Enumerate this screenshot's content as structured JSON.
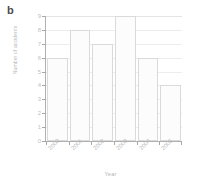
{
  "figure": {
    "panel_label": "b"
  },
  "chart_data": {
    "type": "bar",
    "title": "",
    "categories": [
      "2000",
      "2001",
      "2002",
      "2003",
      "2004",
      "2005"
    ],
    "values": [
      6,
      8,
      7,
      9,
      6,
      4
    ],
    "xlabel": "Year",
    "ylabel": "Number of accidents",
    "ylim": [
      0,
      9
    ],
    "yticks": [
      0,
      1,
      2,
      3,
      4,
      5,
      6,
      7,
      8,
      9
    ],
    "ytick_labels": [
      "0",
      "1",
      "2",
      "3",
      "4",
      "5",
      "6",
      "7",
      "8",
      "9"
    ],
    "grid": true,
    "grid_axis": "y",
    "legend": false,
    "bar_face_color": "#fcfcfc",
    "bar_edge_color": "#dadada",
    "grid_color": "#ededed",
    "axis_color": "#b0b0b0",
    "tick_label_color": "#c0c0c0"
  }
}
